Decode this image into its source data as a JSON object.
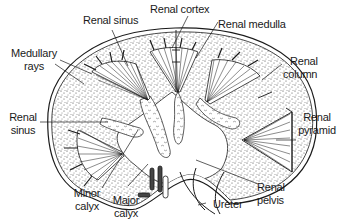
{
  "figure": {
    "colors": {
      "ink": "#1a1a1a",
      "background": "#ffffff",
      "stipple": "#3a3a3a"
    }
  },
  "labels": {
    "renal_sinus_top": {
      "line1": "Renal sinus"
    },
    "renal_cortex": {
      "line1": "Renal cortex"
    },
    "renal_medulla": {
      "line1": "Renal medulla"
    },
    "medullary_rays": {
      "line1": "Medullary",
      "line2": "rays"
    },
    "renal_column": {
      "line1": "Renal",
      "line2": "column"
    },
    "renal_sinus_left": {
      "line1": "Renal",
      "line2": "sinus"
    },
    "renal_pyramid": {
      "line1": "Renal",
      "line2": "pyramid"
    },
    "minor_calyx": {
      "line1": "Minor",
      "line2": "calyx"
    },
    "major_calyx": {
      "line1": "Major",
      "line2": "calyx"
    },
    "renal_pelvis": {
      "line1": "Renal",
      "line2": "pelvis"
    },
    "ureter": {
      "line1": "Ureter"
    }
  }
}
